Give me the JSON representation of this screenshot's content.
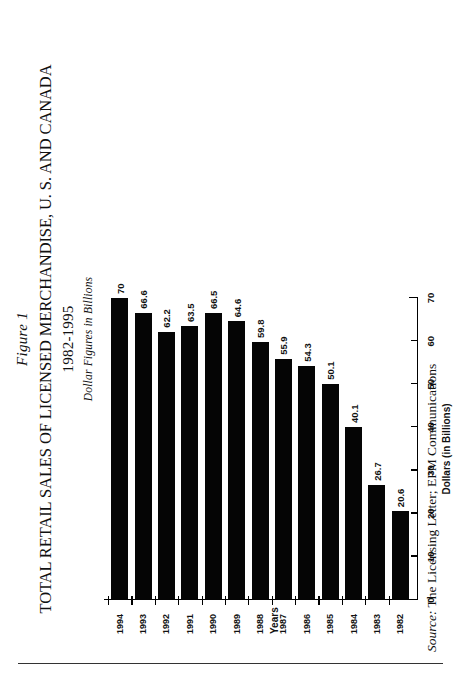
{
  "figure": {
    "number": "Figure 1",
    "title": "TOTAL RETAIL SALES OF LICENSED MERCHANDISE, U. S. AND CANADA",
    "year_range": "1982-1995",
    "units_note": "Dollar Figures in Billions"
  },
  "source": {
    "lead": "Source:",
    "text": " The Licensing Letter; EPM Communications"
  },
  "chart_data": {
    "type": "bar",
    "orientation": "horizontal",
    "title": "TOTAL RETAIL SALES OF LICENSED MERCHANDISE, U. S. AND CANADA",
    "subtitle": "1982-1995",
    "annotation": "Dollar Figures in Billions",
    "xlabel": "Dollars (in Billions)",
    "ylabel": "Years",
    "xlim": [
      0,
      70
    ],
    "xticks": [
      0,
      10,
      20,
      30,
      40,
      50,
      60,
      70
    ],
    "xtick_labels": [
      "0",
      "10",
      "20",
      "30",
      "40",
      "50",
      "60",
      "70"
    ],
    "grid": false,
    "legend": "none",
    "categories": [
      "1982",
      "1983",
      "1984",
      "1985",
      "1986",
      "1987",
      "1988",
      "1989",
      "1990",
      "1991",
      "1992",
      "1993",
      "1994"
    ],
    "values": [
      20.6,
      26.7,
      40.1,
      50.1,
      54.3,
      55.9,
      59.8,
      64.6,
      66.5,
      63.5,
      62.2,
      66.6,
      70
    ],
    "value_labels": [
      "20.6",
      "26.7",
      "40.1",
      "50.1",
      "54.3",
      "55.9",
      "59.8",
      "64.6",
      "66.5",
      "63.5",
      "62.2",
      "66.6",
      "70"
    ],
    "series": [
      {
        "name": "Total retail sales of licensed merchandise",
        "values": [
          20.6,
          26.7,
          40.1,
          50.1,
          54.3,
          55.9,
          59.8,
          64.6,
          66.5,
          63.5,
          62.2,
          66.6,
          70
        ]
      }
    ],
    "bar_color": "#050505"
  }
}
